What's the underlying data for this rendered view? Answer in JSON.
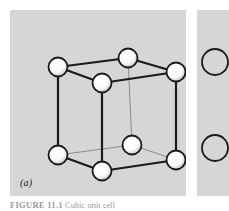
{
  "figure": {
    "panel_a_label": "(a)",
    "caption_prefix": "FIGURE 11.1",
    "caption_text": "Cubic unit cell",
    "background_color": "#ffffff",
    "panel_fill_color": "#d6d6d6",
    "atom_fill_color": "#ffffff",
    "atom_shade_color": "#b4b4b4",
    "atom_outline_color": "#1a1a1a",
    "edge_color": "#1a1a1a",
    "hidden_edge_color": "#8c8c8c"
  },
  "lattice": {
    "type": "cubic-unit-cell",
    "atom_radius": 9.5,
    "atom_count": 8,
    "atoms": [
      {
        "name": "top-back-left",
        "x": 48,
        "y": 57,
        "hidden": false
      },
      {
        "name": "top-back-right",
        "x": 118,
        "y": 48,
        "hidden": false
      },
      {
        "name": "top-front-right",
        "x": 166,
        "y": 62,
        "hidden": false
      },
      {
        "name": "top-front-left",
        "x": 92,
        "y": 73,
        "hidden": false
      },
      {
        "name": "bottom-back-left",
        "x": 48,
        "y": 145,
        "hidden": false
      },
      {
        "name": "bottom-back-right",
        "x": 122,
        "y": 135,
        "hidden": true
      },
      {
        "name": "bottom-front-right",
        "x": 166,
        "y": 150,
        "hidden": false
      },
      {
        "name": "bottom-front-left",
        "x": 92,
        "y": 161,
        "hidden": false
      }
    ],
    "edges": [
      {
        "name": "top-back-left--top-back-right",
        "x1": 48,
        "y1": 57,
        "x2": 118,
        "y2": 48,
        "hidden": false
      },
      {
        "name": "top-back-right--top-front-right",
        "x1": 118,
        "y1": 48,
        "x2": 166,
        "y2": 62,
        "hidden": false
      },
      {
        "name": "top-front-right--top-front-left",
        "x1": 166,
        "y1": 62,
        "x2": 92,
        "y2": 73,
        "hidden": false
      },
      {
        "name": "top-front-left--top-back-left",
        "x1": 92,
        "y1": 73,
        "x2": 48,
        "y2": 57,
        "hidden": false
      },
      {
        "name": "bottom-back-left--bottom-back-right",
        "x1": 48,
        "y1": 145,
        "x2": 122,
        "y2": 135,
        "hidden": true
      },
      {
        "name": "bottom-back-right--bottom-front-right",
        "x1": 122,
        "y1": 135,
        "x2": 166,
        "y2": 150,
        "hidden": true
      },
      {
        "name": "bottom-front-right--bottom-front-left",
        "x1": 166,
        "y1": 150,
        "x2": 92,
        "y2": 161,
        "hidden": false
      },
      {
        "name": "bottom-front-left--bottom-back-left",
        "x1": 92,
        "y1": 161,
        "x2": 48,
        "y2": 145,
        "hidden": false
      },
      {
        "name": "vertical-back-left",
        "x1": 48,
        "y1": 57,
        "x2": 48,
        "y2": 145,
        "hidden": false
      },
      {
        "name": "vertical-back-right",
        "x1": 118,
        "y1": 48,
        "x2": 122,
        "y2": 135,
        "hidden": true
      },
      {
        "name": "vertical-front-right",
        "x1": 166,
        "y1": 62,
        "x2": 166,
        "y2": 150,
        "hidden": false
      },
      {
        "name": "vertical-front-left",
        "x1": 92,
        "y1": 73,
        "x2": 92,
        "y2": 161,
        "hidden": false
      }
    ]
  },
  "panel_b": {
    "note": "adjacent figure panel clipped at crop edge",
    "atoms": [
      {
        "name": "panel-b-atom-upper",
        "x": 18,
        "y": 52,
        "r": 13
      },
      {
        "name": "panel-b-atom-lower",
        "x": 18,
        "y": 138,
        "r": 13
      }
    ]
  }
}
